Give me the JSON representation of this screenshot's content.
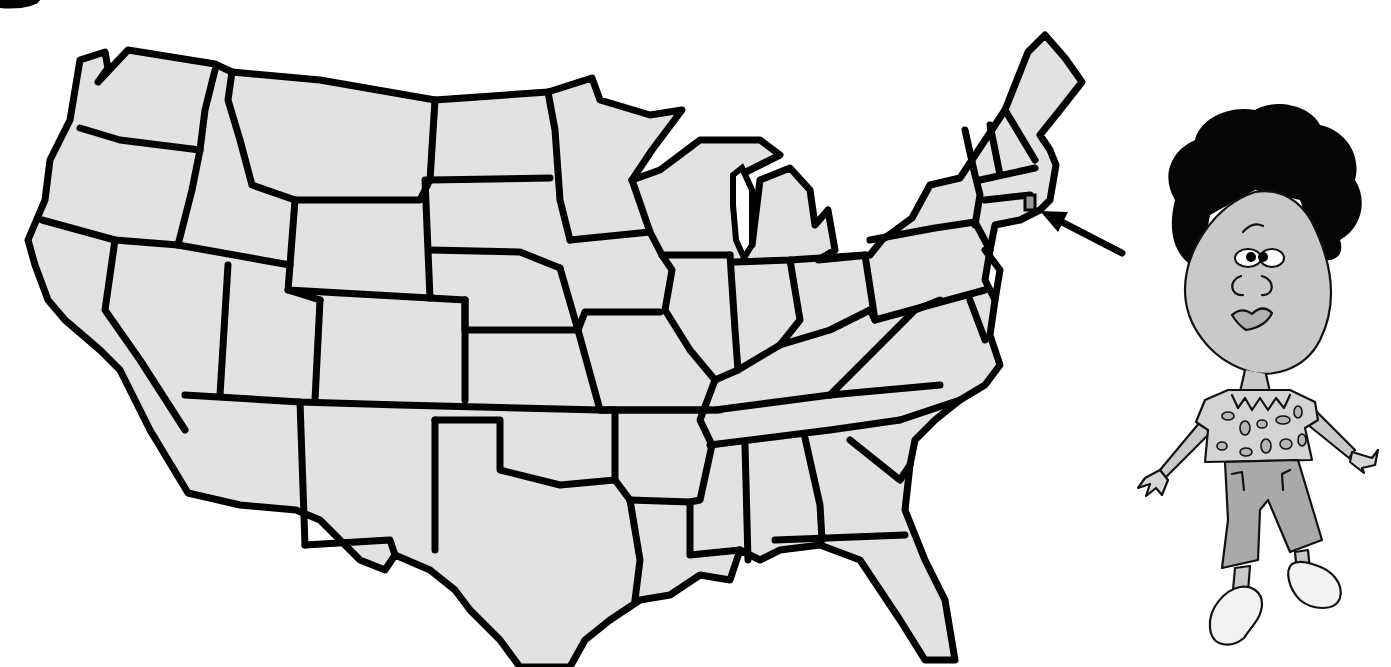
{
  "figure": {
    "type": "outline map illustration",
    "highlighted_state": "Rhode Island",
    "pointer": "arrow pointing to highlighted state",
    "character": "cartoon girl with black curly hair, spotted shirt, capri pants, clogs"
  },
  "map": {
    "states": [
      "Washington",
      "Oregon",
      "California",
      "Idaho",
      "Nevada",
      "Montana",
      "Wyoming",
      "Utah",
      "Arizona",
      "Colorado",
      "New Mexico",
      "North Dakota",
      "South Dakota",
      "Nebraska",
      "Kansas",
      "Oklahoma",
      "Texas",
      "Minnesota",
      "Iowa",
      "Missouri",
      "Arkansas",
      "Louisiana",
      "Wisconsin",
      "Illinois",
      "Michigan",
      "Indiana",
      "Ohio",
      "Kentucky",
      "Tennessee",
      "Mississippi",
      "Alabama",
      "Georgia",
      "Florida",
      "South Carolina",
      "North Carolina",
      "Virginia",
      "West Virginia",
      "Pennsylvania",
      "New York",
      "Vermont",
      "New Hampshire",
      "Maine",
      "Massachusetts",
      "Rhode Island",
      "Connecticut",
      "New Jersey",
      "Delaware",
      "Maryland"
    ],
    "colors": {
      "land": "#e2e2e2",
      "border": "#000000",
      "highlight": "#9a9a9a",
      "background": "#ffffff"
    }
  }
}
